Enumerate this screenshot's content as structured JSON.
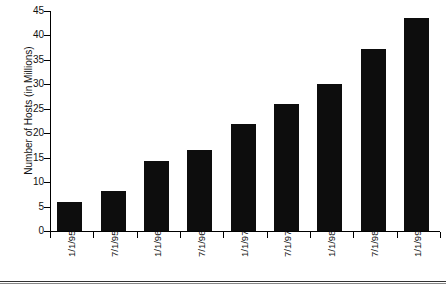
{
  "chart_data": {
    "type": "bar",
    "title": "",
    "xlabel": "",
    "ylabel": "Number of Hosts (in Millions)",
    "categories": [
      "1/1/95",
      "7/1/95",
      "1/1/96",
      "7/1/96",
      "1/1/97",
      "7/1/97",
      "1/1/98",
      "7/1/98",
      "1/1/99"
    ],
    "values": [
      6,
      8.2,
      14.3,
      16.6,
      21.8,
      26,
      30,
      37.2,
      43.5
    ],
    "ylim": [
      0,
      45
    ],
    "ytick_labels": [
      "45",
      "40",
      "35",
      "30",
      "25",
      "20",
      "15",
      "10",
      "5",
      "0"
    ],
    "ytick_values": [
      45,
      40,
      35,
      30,
      25,
      20,
      15,
      10,
      5,
      0
    ],
    "grid": false,
    "legend": null,
    "bar_color": "#0d0d0d",
    "axis_color": "#000000"
  }
}
